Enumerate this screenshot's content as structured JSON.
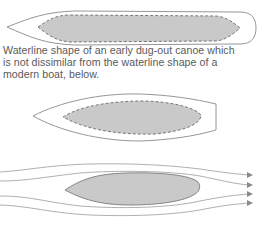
{
  "caption": {
    "lines": [
      "Waterline shape of an early dug-out canoe which",
      "is not dissimilar from the waterline shape of a",
      "modern boat, below."
    ]
  },
  "figures": [
    {
      "name": "dug-out-canoe-waterline",
      "outline": "hull with pointed bow and rounded stern",
      "inner": "dashed shaded waterline area"
    },
    {
      "name": "modern-boat-waterline",
      "outline": "hull with pointed bow and flat transom",
      "inner": "dashed shaded waterline area"
    },
    {
      "name": "streamline-flow",
      "body": "shaded teardrop hull",
      "streamlines": 4,
      "direction": "left-to-right arrows"
    }
  ],
  "colors": {
    "outline": "#8a8a8a",
    "fill": "#c9c9c9",
    "dash": "#6a6a6a",
    "text": "#5a5a5a",
    "flow": "#9a9a9a"
  }
}
